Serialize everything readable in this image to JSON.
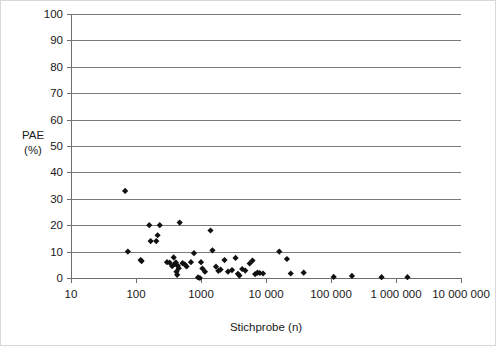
{
  "chart_data": {
    "type": "scatter",
    "title": "",
    "xlabel": "Stichprobe (n)",
    "ylabel": "PAE\n(%)",
    "ylabel_line1": "PAE",
    "ylabel_line2": "(%)",
    "xscale": "log",
    "yscale": "linear",
    "xlim": [
      10,
      10000000
    ],
    "ylim": [
      0,
      100
    ],
    "grid": "horizontal",
    "legend": "none",
    "x_tick_labels": [
      "10",
      "100",
      "1000",
      "10 000",
      "100 000",
      "1 000 000",
      "10 000 000"
    ],
    "x_tick_values": [
      10,
      100,
      1000,
      10000,
      100000,
      1000000,
      10000000
    ],
    "y_tick_labels": [
      "0",
      "10",
      "20",
      "30",
      "40",
      "50",
      "60",
      "70",
      "80",
      "90",
      "100"
    ],
    "y_tick_values": [
      0,
      10,
      20,
      30,
      40,
      50,
      60,
      70,
      80,
      90,
      100
    ],
    "marker": "diamond",
    "marker_color": "#111111",
    "series": [
      {
        "name": "PAE vs Stichprobe",
        "points": [
          [
            68,
            33.0
          ],
          [
            75,
            10.0
          ],
          [
            118,
            6.8
          ],
          [
            122,
            6.4
          ],
          [
            160,
            20.0
          ],
          [
            168,
            14.0
          ],
          [
            205,
            14.0
          ],
          [
            215,
            16.2
          ],
          [
            232,
            20.0
          ],
          [
            300,
            6.0
          ],
          [
            330,
            5.8
          ],
          [
            360,
            4.5
          ],
          [
            380,
            7.8
          ],
          [
            395,
            5.2
          ],
          [
            410,
            5.9
          ],
          [
            420,
            2.4
          ],
          [
            430,
            1.2
          ],
          [
            440,
            4.6
          ],
          [
            455,
            3.7
          ],
          [
            470,
            21.0
          ],
          [
            520,
            5.6
          ],
          [
            560,
            5.2
          ],
          [
            600,
            4.4
          ],
          [
            700,
            6.0
          ],
          [
            780,
            9.4
          ],
          [
            900,
            0.2
          ],
          [
            960,
            0.0
          ],
          [
            1000,
            6.0
          ],
          [
            1050,
            3.6
          ],
          [
            1150,
            2.4
          ],
          [
            1400,
            18.0
          ],
          [
            1500,
            10.5
          ],
          [
            1700,
            4.3
          ],
          [
            1850,
            2.7
          ],
          [
            2000,
            3.2
          ],
          [
            2300,
            6.8
          ],
          [
            2600,
            2.4
          ],
          [
            3000,
            3.0
          ],
          [
            3400,
            7.6
          ],
          [
            3700,
            1.6
          ],
          [
            3900,
            0.9
          ],
          [
            4300,
            3.4
          ],
          [
            4800,
            2.8
          ],
          [
            5600,
            5.5
          ],
          [
            6200,
            6.6
          ],
          [
            6800,
            1.5
          ],
          [
            7400,
            2.0
          ],
          [
            8000,
            1.9
          ],
          [
            9000,
            1.7
          ],
          [
            16000,
            10.0
          ],
          [
            21000,
            7.2
          ],
          [
            24000,
            1.7
          ],
          [
            38000,
            2.0
          ],
          [
            110000,
            0.4
          ],
          [
            210000,
            0.8
          ],
          [
            600000,
            0.3
          ],
          [
            1500000,
            0.3
          ]
        ]
      }
    ]
  },
  "figure": {
    "background_color": "#ffffff",
    "border_color": "#d8d8d8",
    "gridline_color": "#7a7a7a",
    "axis_color": "#6e6e6e"
  }
}
